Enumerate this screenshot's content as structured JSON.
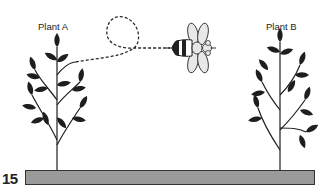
{
  "figure": {
    "number": "15",
    "plant_a": {
      "label": "Plant A"
    },
    "plant_b": {
      "label": "Plant B"
    },
    "bee": {
      "name": "bee"
    },
    "flight_path": {
      "style": "dashed",
      "from": "Plant A",
      "to": "bee"
    },
    "ground": {
      "color": "#9a9a9a"
    }
  }
}
